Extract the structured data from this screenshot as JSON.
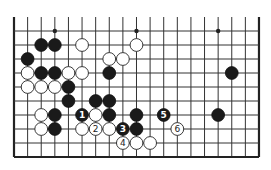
{
  "diagram": {
    "type": "go-board-fragment",
    "board": {
      "columns": 19,
      "rows_shown": 10,
      "origin_x": 14,
      "origin_y": 31,
      "col_spacing": 13.61,
      "row_spacing": 14,
      "top_open_to_y": 17,
      "edges": [
        "left",
        "right",
        "bottom"
      ],
      "line_color": "#333333"
    },
    "star_points": [
      {
        "col": 3,
        "row": 0
      },
      {
        "col": 9,
        "row": 0
      },
      {
        "col": 15,
        "row": 0
      }
    ],
    "stones": [
      {
        "color": "black",
        "col": 2,
        "row": 1
      },
      {
        "color": "black",
        "col": 3,
        "row": 1
      },
      {
        "color": "white",
        "col": 5,
        "row": 1
      },
      {
        "color": "white",
        "col": 9,
        "row": 1
      },
      {
        "color": "black",
        "col": 1,
        "row": 2
      },
      {
        "color": "white",
        "col": 7,
        "row": 2
      },
      {
        "color": "white",
        "col": 8,
        "row": 2
      },
      {
        "color": "white",
        "col": 1,
        "row": 3
      },
      {
        "color": "black",
        "col": 2,
        "row": 3
      },
      {
        "color": "black",
        "col": 3,
        "row": 3
      },
      {
        "color": "white",
        "col": 4,
        "row": 3
      },
      {
        "color": "white",
        "col": 5,
        "row": 3
      },
      {
        "color": "black",
        "col": 7,
        "row": 3
      },
      {
        "color": "black",
        "col": 16,
        "row": 3
      },
      {
        "color": "white",
        "col": 1,
        "row": 4
      },
      {
        "color": "white",
        "col": 2,
        "row": 4
      },
      {
        "color": "white",
        "col": 3,
        "row": 4
      },
      {
        "color": "black",
        "col": 4,
        "row": 4
      },
      {
        "color": "black",
        "col": 4,
        "row": 5
      },
      {
        "color": "black",
        "col": 6,
        "row": 5
      },
      {
        "color": "black",
        "col": 7,
        "row": 5
      },
      {
        "color": "white",
        "col": 2,
        "row": 6
      },
      {
        "color": "black",
        "col": 3,
        "row": 6
      },
      {
        "color": "black",
        "col": 5,
        "row": 6,
        "label": "1"
      },
      {
        "color": "white",
        "col": 6,
        "row": 6
      },
      {
        "color": "black",
        "col": 7,
        "row": 6
      },
      {
        "color": "black",
        "col": 9,
        "row": 6
      },
      {
        "color": "black",
        "col": 11,
        "row": 6,
        "label": "5"
      },
      {
        "color": "black",
        "col": 15,
        "row": 6
      },
      {
        "color": "white",
        "col": 2,
        "row": 7
      },
      {
        "color": "black",
        "col": 3,
        "row": 7
      },
      {
        "color": "white",
        "col": 5,
        "row": 7
      },
      {
        "color": "white",
        "col": 6,
        "row": 7,
        "label": "2"
      },
      {
        "color": "white",
        "col": 7,
        "row": 7
      },
      {
        "color": "black",
        "col": 8,
        "row": 7,
        "label": "3"
      },
      {
        "color": "black",
        "col": 9,
        "row": 7
      },
      {
        "color": "white",
        "col": 12,
        "row": 7,
        "label": "6"
      },
      {
        "color": "white",
        "col": 8,
        "row": 8,
        "label": "4"
      },
      {
        "color": "white",
        "col": 9,
        "row": 8
      },
      {
        "color": "white",
        "col": 10,
        "row": 8
      }
    ],
    "move_labels": [
      "1",
      "2",
      "3",
      "4",
      "5",
      "6"
    ],
    "colors": {
      "black_stone": "#1a1a1a",
      "white_stone": "#ffffff",
      "background": "#ffffff"
    }
  }
}
